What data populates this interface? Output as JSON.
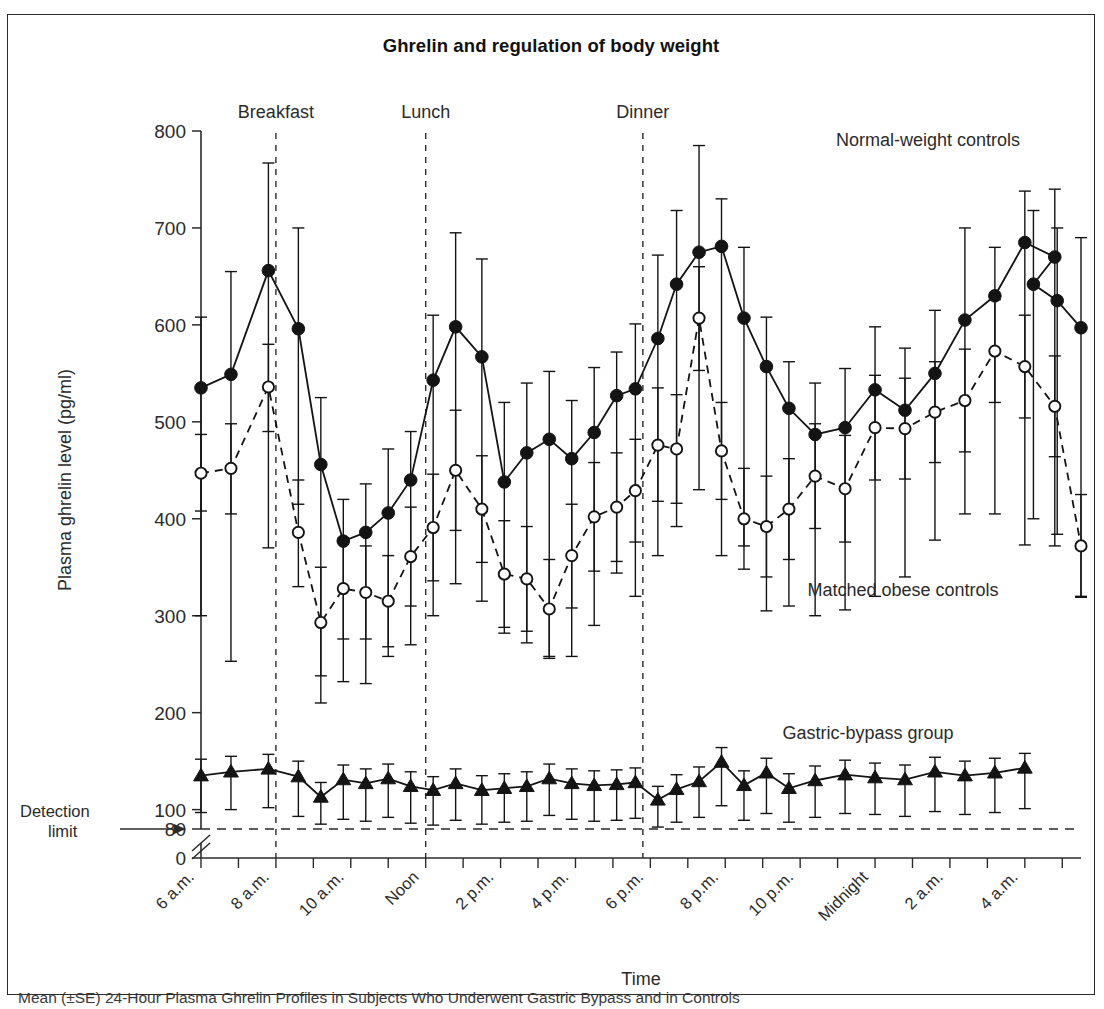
{
  "figure": {
    "title": "Ghrelin and regulation of body weight",
    "caption": "Mean (±SE) 24-Hour Plasma Ghrelin Profiles in Subjects Who Underwent Gastric Bypass and in Controls"
  },
  "annotations": {
    "meals": [
      {
        "label": "Breakfast",
        "hour": 8
      },
      {
        "label": "Lunch",
        "hour": 12
      },
      {
        "label": "Dinner",
        "hour": 17.8
      }
    ],
    "detection_limit": {
      "label_line1": "Detection",
      "label_line2": "limit",
      "value": 80
    },
    "series_labels": [
      {
        "label": "Normal-weight controls",
        "series": "normal_weight_controls"
      },
      {
        "label": "Matched obese controls",
        "series": "matched_obese_controls"
      },
      {
        "label": "Gastric-bypass group",
        "series": "gastric_bypass_group"
      }
    ]
  },
  "chart_data": {
    "type": "line",
    "title": "Ghrelin and regulation of body weight",
    "xlabel": "Time",
    "ylabel": "Plasma ghrelin level (pg/ml)",
    "ylim": [
      80,
      800
    ],
    "yticks": [
      80,
      100,
      200,
      300,
      400,
      500,
      600,
      700,
      800
    ],
    "y_axis_break": {
      "below": 80,
      "zero_tick": 0
    },
    "grid": false,
    "legend_position": "in-plot-annotations",
    "xlim_hours": [
      6,
      29.5
    ],
    "x_tick_hours": [
      6,
      7,
      8,
      9,
      10,
      11,
      12,
      13,
      14,
      15,
      16,
      17,
      18,
      19,
      20,
      21,
      22,
      23,
      24,
      25,
      26,
      27,
      28,
      29
    ],
    "xtick_labels": [
      {
        "hour": 6,
        "label": "6 a.m."
      },
      {
        "hour": 8,
        "label": "8 a.m."
      },
      {
        "hour": 10,
        "label": "10 a.m."
      },
      {
        "hour": 12,
        "label": "Noon"
      },
      {
        "hour": 14,
        "label": "2 p.m."
      },
      {
        "hour": 16,
        "label": "4 p.m."
      },
      {
        "hour": 18,
        "label": "6 p.m."
      },
      {
        "hour": 20,
        "label": "8 p.m."
      },
      {
        "hour": 22,
        "label": "10 p.m."
      },
      {
        "hour": 24,
        "label": "Midnight"
      },
      {
        "hour": 26,
        "label": "2 a.m."
      },
      {
        "hour": 28,
        "label": "4 a.m."
      }
    ],
    "x_hours": [
      6,
      6.8,
      7.8,
      8.6,
      9.2,
      9.8,
      10.4,
      11,
      11.6,
      12.2,
      12.8,
      13.5,
      14.1,
      14.7,
      15.3,
      15.9,
      16.5,
      17.1,
      17.6,
      18.2,
      18.7,
      19.3,
      19.9,
      20.5,
      21.1,
      21.7,
      22.4,
      23.2,
      24.0,
      24.8,
      25.6,
      26.4,
      27.2,
      28.0,
      28.8
    ],
    "series": [
      {
        "name": "Normal-weight controls",
        "key": "normal_weight_controls",
        "marker": "filled-circle",
        "line": "solid",
        "values": [
          535,
          549,
          656,
          596,
          456,
          377,
          386,
          406,
          440,
          543,
          598,
          567,
          438,
          468,
          482,
          462,
          489,
          527,
          534,
          586,
          642,
          675,
          681,
          607,
          557,
          514,
          487,
          494,
          533,
          512,
          550,
          605,
          630,
          685,
          670,
          642,
          625,
          597
        ],
        "errors_upper": [
          608,
          655,
          767,
          700,
          525,
          420,
          436,
          472,
          490,
          610,
          695,
          668,
          520,
          540,
          552,
          522,
          556,
          572,
          601,
          672,
          718,
          785,
          730,
          680,
          608,
          562,
          540,
          555,
          598,
          576,
          615,
          700,
          680,
          738,
          740,
          718,
          700,
          690
        ],
        "errors_lower": [
          300,
          253,
          370,
          415,
          210,
          232,
          230,
          258,
          270,
          300,
          333,
          315,
          282,
          272,
          258,
          258,
          290,
          344,
          320,
          362,
          392,
          430,
          362,
          372,
          305,
          310,
          300,
          306,
          320,
          340,
          378,
          405,
          405,
          373,
          372,
          400,
          384,
          320
        ]
      },
      {
        "name": "Matched obese controls",
        "key": "matched_obese_controls",
        "marker": "open-circle",
        "line": "dashed",
        "values": [
          447,
          452,
          536,
          386,
          293,
          328,
          324,
          315,
          361,
          391,
          450,
          410,
          343,
          338,
          307,
          362,
          402,
          412,
          429,
          476,
          472,
          607,
          470,
          400,
          392,
          410,
          444,
          431,
          494,
          493,
          510,
          522,
          573,
          557,
          516,
          372
        ],
        "errors_upper": [
          487,
          498,
          580,
          440,
          350,
          380,
          372,
          362,
          412,
          446,
          512,
          465,
          398,
          392,
          358,
          415,
          458,
          468,
          482,
          535,
          528,
          660,
          520,
          452,
          444,
          462,
          498,
          486,
          548,
          545,
          562,
          575,
          626,
          610,
          568,
          425
        ],
        "errors_lower": [
          408,
          405,
          490,
          330,
          238,
          276,
          276,
          268,
          310,
          336,
          388,
          355,
          288,
          284,
          256,
          308,
          346,
          356,
          376,
          418,
          416,
          553,
          420,
          348,
          340,
          358,
          390,
          376,
          440,
          441,
          458,
          469,
          520,
          504,
          464,
          319
        ]
      },
      {
        "name": "Gastric-bypass group",
        "key": "gastric_bypass_group",
        "marker": "filled-triangle",
        "line": "solid",
        "values": [
          135,
          139,
          142,
          134,
          113,
          131,
          127,
          132,
          124,
          120,
          127,
          120,
          122,
          124,
          132,
          127,
          125,
          126,
          128,
          110,
          121,
          129,
          149,
          125,
          138,
          122,
          130,
          136,
          133,
          131,
          139,
          135,
          138,
          143
        ],
        "errors_upper": [
          152,
          155,
          157,
          150,
          128,
          146,
          142,
          147,
          139,
          134,
          142,
          135,
          137,
          139,
          147,
          142,
          140,
          141,
          143,
          124,
          136,
          144,
          164,
          140,
          153,
          137,
          145,
          151,
          148,
          146,
          154,
          150,
          153,
          158
        ],
        "errors_lower": [
          97,
          100,
          102,
          93,
          85,
          90,
          88,
          92,
          86,
          84,
          89,
          85,
          87,
          88,
          94,
          90,
          88,
          89,
          91,
          82,
          87,
          92,
          104,
          89,
          96,
          87,
          92,
          96,
          95,
          93,
          98,
          95,
          97,
          101
        ]
      }
    ]
  }
}
